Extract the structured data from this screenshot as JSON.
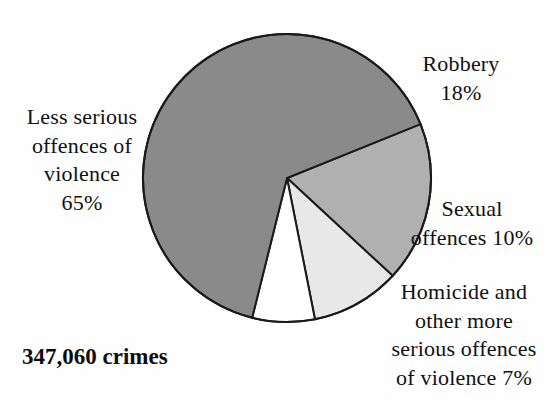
{
  "figure": {
    "total_caption": "347,060 crimes",
    "background_color": "#fefefe",
    "outline_color": "#1a1a1a"
  },
  "labels": {
    "less_serious": {
      "line1": "Less serious",
      "line2": "offences of",
      "line3": "violence",
      "line4": "65%"
    },
    "robbery": {
      "line1": "Robbery",
      "line2": "18%"
    },
    "sexual": {
      "line1": "Sexual",
      "line2": "offences 10%"
    },
    "homicide": {
      "line1": "Homicide and",
      "line2": "other more",
      "line3": "serious offences",
      "line4": "of violence 7%"
    }
  },
  "chart_data": {
    "type": "pie",
    "title": "",
    "subtitle": "",
    "xlabel": "",
    "ylabel": "",
    "total_label": "347,060 crimes",
    "total_value": 347060,
    "units": "crimes",
    "legend_position": "outside-callout-labels",
    "grid": false,
    "start_angle_deg": -22,
    "direction": "clockwise",
    "center": {
      "x": 287,
      "y": 178
    },
    "radius": 144,
    "categories": [
      "Robbery",
      "Sexual offences",
      "Homicide and other more serious offences of violence",
      "Less serious offences of violence"
    ],
    "values": [
      18,
      10,
      7,
      65
    ],
    "value_labels": [
      "18%",
      "10%",
      "7%",
      "65%"
    ],
    "colors": [
      "#b0b0b0",
      "#e8e8e8",
      "#ffffff",
      "#8a8a8a"
    ],
    "slices": [
      {
        "name": "Robbery",
        "percent": 18,
        "label": "Robbery",
        "value_label": "18%",
        "color": "#b0b0b0",
        "start_angle_deg": -22,
        "end_angle_deg": 42.8
      },
      {
        "name": "Sexual offences",
        "percent": 10,
        "label": "Sexual offences",
        "value_label": "10%",
        "color": "#e8e8e8",
        "start_angle_deg": 42.8,
        "end_angle_deg": 78.8
      },
      {
        "name": "Homicide and other more serious offences of violence",
        "percent": 7,
        "label": "Homicide and other more serious offences of violence",
        "value_label": "7%",
        "color": "#ffffff",
        "start_angle_deg": 78.8,
        "end_angle_deg": 104.0
      },
      {
        "name": "Less serious offences of violence",
        "percent": 65,
        "label": "Less serious offences of violence",
        "value_label": "65%",
        "color": "#8a8a8a",
        "start_angle_deg": 104.0,
        "end_angle_deg": 338.0
      }
    ]
  }
}
